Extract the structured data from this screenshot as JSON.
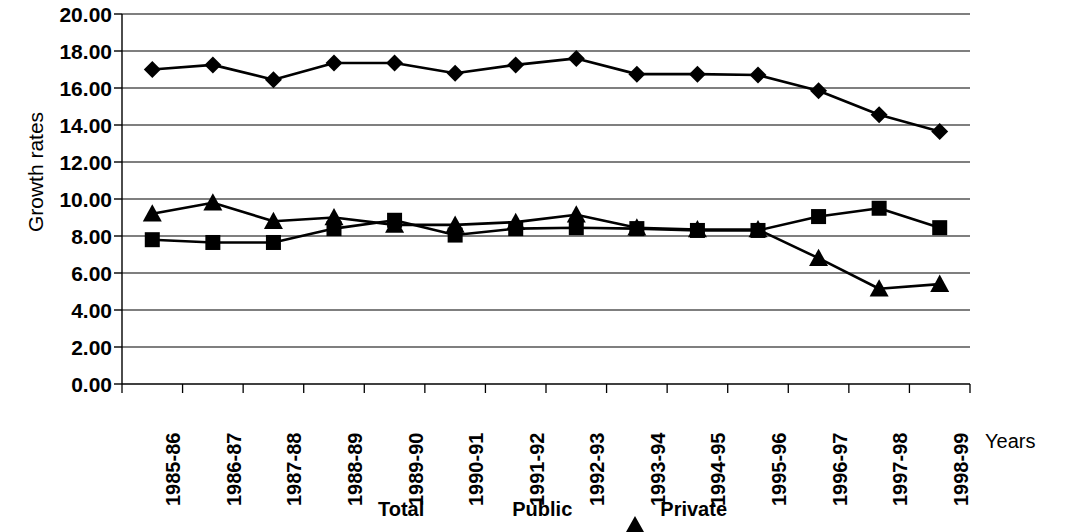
{
  "chart_data": {
    "type": "line",
    "title": "",
    "xlabel": "Years",
    "ylabel": "Growth rates",
    "categories": [
      "1985-86",
      "1986-87",
      "1987-88",
      "1988-89",
      "1989-90",
      "1990-91",
      "1991-92",
      "1992-93",
      "1993-94",
      "1994-95",
      "1995-96",
      "1996-97",
      "1997-98",
      "1998-99"
    ],
    "ylim": [
      0,
      20
    ],
    "ytick_step": 2,
    "yticks": [
      "20.00",
      "18.00",
      "16.00",
      "14.00",
      "12.00",
      "10.00",
      "8.00",
      "6.00",
      "4.00",
      "2.00",
      "0.00"
    ],
    "ytick_values": [
      20,
      18,
      16,
      14,
      12,
      10,
      8,
      6,
      4,
      2,
      0
    ],
    "grid": "horizontal",
    "legend_position": "bottom",
    "series": [
      {
        "name": "Total",
        "marker": "diamond",
        "color": "#000000",
        "values": [
          17.0,
          17.25,
          16.45,
          17.35,
          17.35,
          16.8,
          17.25,
          17.6,
          16.75,
          16.75,
          16.7,
          15.85,
          14.55,
          13.65
        ]
      },
      {
        "name": "Public",
        "marker": "square",
        "color": "#000000",
        "values": [
          7.8,
          7.65,
          7.65,
          8.4,
          8.85,
          8.05,
          8.4,
          8.45,
          8.4,
          8.3,
          8.3,
          9.05,
          9.5,
          8.45
        ]
      },
      {
        "name": "Private",
        "marker": "triangle",
        "color": "#000000",
        "values": [
          9.2,
          9.8,
          8.8,
          9.0,
          8.6,
          8.6,
          8.75,
          9.15,
          8.45,
          8.35,
          8.35,
          6.8,
          5.15,
          5.4
        ]
      }
    ]
  },
  "axis": {
    "y_title": "Growth rates",
    "x_title": "Years"
  },
  "legend": {
    "entries": [
      {
        "label": "Total",
        "marker": "diamond-marker-icon"
      },
      {
        "label": "Public",
        "marker": "square-marker-icon"
      },
      {
        "label": "Private",
        "marker": "triangle-marker-icon"
      }
    ]
  }
}
